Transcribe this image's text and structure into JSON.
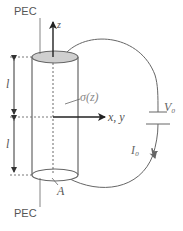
{
  "diagram": {
    "type": "schematic",
    "title": "",
    "labels": {
      "pec_top": "PEC",
      "pec_bottom": "PEC",
      "z_axis": "z",
      "xy_axis": "x, y",
      "conductivity": "σ(z)",
      "length_upper": "l",
      "length_lower": "l",
      "area": "A",
      "voltage": "V₀",
      "current": "I₀"
    },
    "elements": [
      {
        "id": "cylinder",
        "kind": "conductor",
        "description": "vertical cylinder with conductivity σ(z)"
      },
      {
        "id": "top-cap",
        "kind": "electrode",
        "label": "PEC"
      },
      {
        "id": "bottom-cap",
        "kind": "electrode",
        "label": "PEC"
      },
      {
        "id": "battery",
        "kind": "voltage-source",
        "label": "V₀"
      },
      {
        "id": "wire",
        "kind": "circuit-wire",
        "current": "I₀"
      }
    ],
    "colors": {
      "stroke": "#555555",
      "cap_fill": "#cccccc",
      "axis": "#222222"
    }
  }
}
